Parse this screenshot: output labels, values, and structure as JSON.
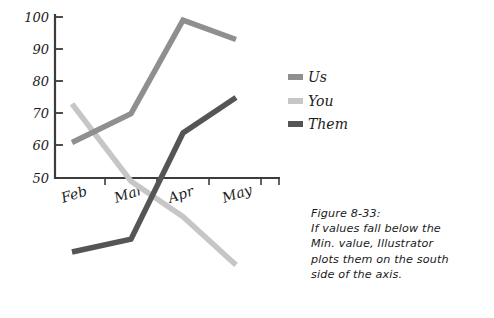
{
  "figure": {
    "caption_lines": [
      "Figure 8-33:",
      "If values fall below the",
      "Min. value, Illustrator",
      "plots them on the south",
      "side of the axis."
    ]
  },
  "legend": {
    "position": "right",
    "entries": [
      {
        "label": "Us",
        "color": "#8f8f8f"
      },
      {
        "label": "You",
        "color": "#c6c6c6"
      },
      {
        "label": "Them",
        "color": "#555555"
      }
    ]
  },
  "chart_data": {
    "type": "line",
    "title": "",
    "xlabel": "",
    "ylabel": "",
    "categories": [
      "Feb",
      "Mar",
      "Apr",
      "May"
    ],
    "ytick_labels": [
      "50",
      "60",
      "70",
      "80",
      "90",
      "100"
    ],
    "ytick_values": [
      50,
      60,
      70,
      80,
      90,
      100
    ],
    "ylim": [
      50,
      100
    ],
    "grid": false,
    "legend_position": "right",
    "note": "Values below the axis minimum (50) are plotted south of the axis.",
    "series": [
      {
        "name": "Us",
        "color": "#8f8f8f",
        "values": [
          61,
          70,
          99,
          93
        ]
      },
      {
        "name": "You",
        "color": "#c6c6c6",
        "values": [
          73,
          49,
          38,
          23
        ]
      },
      {
        "name": "Them",
        "color": "#555555",
        "values": [
          27,
          31,
          64,
          75
        ]
      }
    ]
  },
  "axis": {
    "line_color": "#3c3c3c",
    "y_axis_x": 55,
    "x_axis_y": 178,
    "x_axis_end": 280,
    "y_axis_top": 14,
    "category_x": [
      72,
      105,
      157,
      209,
      261
    ],
    "ytick_y": [
      178,
      145,
      113,
      81,
      49,
      17
    ]
  }
}
